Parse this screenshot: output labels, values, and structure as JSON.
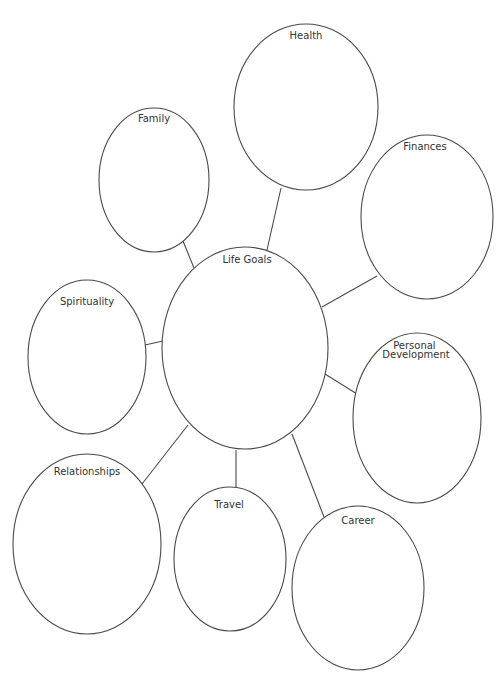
{
  "diagram": {
    "type": "mind-map",
    "center": {
      "id": "life-goals",
      "label": "Life Goals"
    },
    "branches": [
      {
        "id": "health",
        "label": "Health"
      },
      {
        "id": "family",
        "label": "Family"
      },
      {
        "id": "finances",
        "label": "Finances"
      },
      {
        "id": "spirituality",
        "label": "Spirituality"
      },
      {
        "id": "personal-development",
        "label": "Personal Development",
        "lines": [
          "Personal",
          "Development"
        ]
      },
      {
        "id": "relationships",
        "label": "Relationships"
      },
      {
        "id": "travel",
        "label": "Travel"
      },
      {
        "id": "career",
        "label": "Career"
      }
    ],
    "colors": {
      "stroke": "#4a4a4a",
      "text": "#333333",
      "background": "#ffffff"
    }
  }
}
